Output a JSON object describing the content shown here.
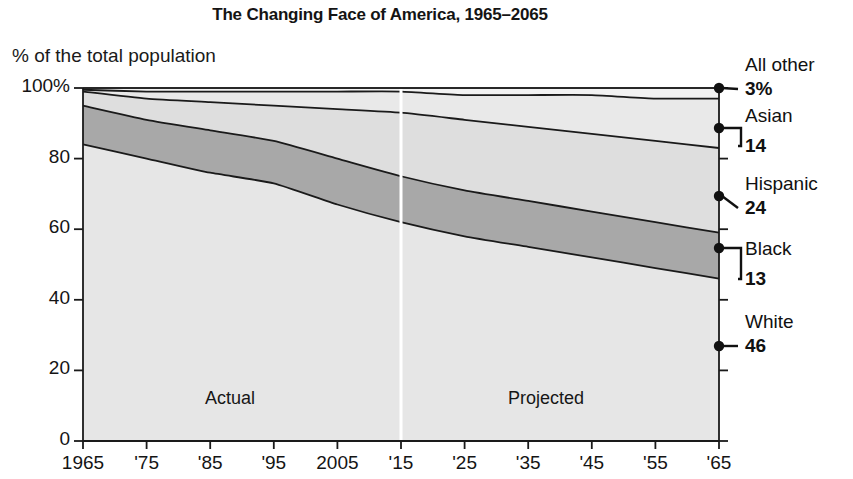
{
  "header": {
    "title": "The Changing Face of America, 1965–2065",
    "subtitle": "% of the total population"
  },
  "annotations": {
    "actual": "Actual",
    "projected": "Projected"
  },
  "side_labels": [
    {
      "name": "All other",
      "value": "3%"
    },
    {
      "name": "Asian",
      "value": "14"
    },
    {
      "name": "Hispanic",
      "value": "24"
    },
    {
      "name": "Black",
      "value": "13"
    },
    {
      "name": "White",
      "value": "46"
    }
  ],
  "colors": {
    "white_band": "#e6e6e6",
    "black_band": "#a8a8a8",
    "hispanic_band": "#dedede",
    "asian_band": "#e9e9e9",
    "allother_band": "#f2f2f2",
    "outline": "#1a1a1a",
    "divider": "#ffffff"
  },
  "chart_data": {
    "type": "area",
    "title": "The Changing Face of America, 1965–2065",
    "subtitle": "% of the total population",
    "xlabel": "",
    "ylabel": "% of the total population",
    "stacked": true,
    "grid": false,
    "legend_position": "right-annotations",
    "xlim": [
      1965,
      2065
    ],
    "ylim": [
      0,
      100
    ],
    "yticks": [
      0,
      20,
      40,
      60,
      80,
      100
    ],
    "ytick_labels": [
      "0",
      "20",
      "40",
      "60",
      "80",
      "100%"
    ],
    "xticks": [
      1965,
      1975,
      1985,
      1995,
      2005,
      2015,
      2025,
      2035,
      2045,
      2055,
      2065
    ],
    "xtick_labels": [
      "1965",
      "'75",
      "'85",
      "'95",
      "2005",
      "'15",
      "'25",
      "'35",
      "'45",
      "'55",
      "'65"
    ],
    "divider_year": 2015,
    "divider_note_left": "Actual",
    "divider_note_right": "Projected",
    "x": [
      1965,
      1975,
      1985,
      1995,
      2005,
      2015,
      2025,
      2035,
      2045,
      2055,
      2065
    ],
    "series": [
      {
        "name": "White",
        "values": [
          84,
          80,
          76,
          73,
          67,
          62,
          58,
          55,
          52,
          49,
          46
        ]
      },
      {
        "name": "Black",
        "values": [
          11,
          11,
          12,
          12,
          13,
          13,
          13,
          13,
          13,
          13,
          13
        ]
      },
      {
        "name": "Hispanic",
        "values": [
          4,
          6,
          8,
          10,
          14,
          18,
          20,
          21,
          22,
          23,
          24
        ]
      },
      {
        "name": "Asian",
        "values": [
          0.5,
          2,
          3,
          4,
          5,
          6,
          7,
          9,
          11,
          12,
          14
        ]
      },
      {
        "name": "All other",
        "values": [
          0.5,
          1,
          1,
          1,
          1,
          1,
          2,
          2,
          2,
          3,
          3
        ]
      }
    ],
    "endpoint_values_2065": {
      "White": 46,
      "Black": 13,
      "Hispanic": 24,
      "Asian": 14,
      "All other": 3
    }
  }
}
